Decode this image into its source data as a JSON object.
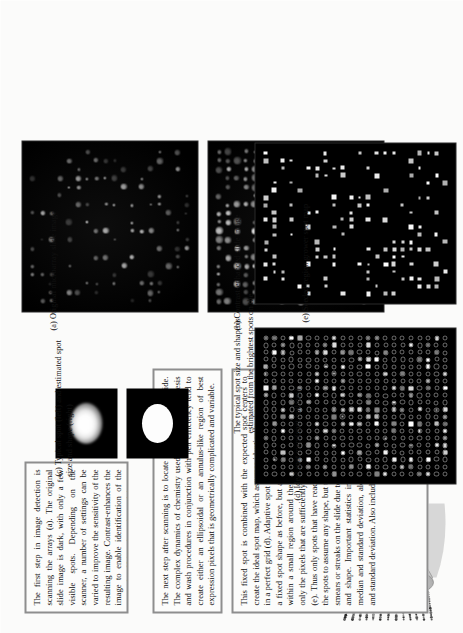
{
  "document": {
    "type": "figure-page",
    "orientation": "rotated-90-ccw",
    "page_background": "#fbfbfa",
    "ink_color": "#111111",
    "panel_border_color": "#8e8e8e"
  },
  "body_text": [
    {
      "id": "para-1",
      "text": "The first step in image detection is scanning the arrays (a). The original slide image is dark, with only a few visible spots. Depending on the scanner, a number of settings can be varied to improve the sensitivity of the resulting image. Contrast-enhances the image to enable identification of the spots (b). Using the enhanced image, initial spot center estimates are created  (c)."
    },
    {
      "id": "para-2",
      "text": "The next step after scanning is to locate each spot on the slide. The complex dynamics of chemistry used in the probe synthesis and wash procedures in conjunction with pen efficiency tend to create either an ellipsoidal or an annulus-like region of best expression pixels that is geometrically complicated and variable."
    },
    {
      "id": "para-3",
      "text": "This fixed spot is combined with the expected spot centers to create the ideal spot map, which assumes identically-shaped spots in a perfect grid (d). Adaptive spot identification methods: assume a fixed spot shape as before, but allows the spot centers to vary within a small region around the expected location or identify only the pixels that are sufficiently different from the background (e). Thus only spots that have reacted will be found. This allows the spots to assume any shape, but the algorithm may also identify smears or streaks on the slide due to the lack of constraints on size and shape. Important statistics include the typical spot mean, median and standard deviation, along with background intensity and standard deviation. Also included are size and shape statistics."
    }
  ],
  "annotation_note": {
    "id": "spot-size-note",
    "text": "The typical spot size and shape is estimated from the brightest spots on the slide"
  },
  "figures": [
    {
      "id": "fig-a",
      "caption": "(a) Original microarray slide image",
      "kind": "microarray-slide",
      "description": "dark scanned slide with few faint spots"
    },
    {
      "id": "fig-b",
      "caption": "(b) Contrast-enhanced slide image",
      "kind": "microarray-slide",
      "description": "contrast enhanced scan, many bright spots visible"
    },
    {
      "id": "fig-c",
      "caption": "(c) Typical spot (left) and estimated spot size and shape (right)",
      "kind": "spot-closeup-pair",
      "left_label": "typical spot",
      "right_label": "estimated spot size and shape"
    },
    {
      "id": "fig-d",
      "caption": "(d) Ideal spot map (spot outlines)",
      "kind": "spot-map-outlines",
      "description": "regular grid of circular spot outlines over the slide"
    },
    {
      "id": "fig-e",
      "caption": "(e) Seeded-region grower spot map",
      "kind": "spot-map-seeded",
      "description": "black background with detected white square spots"
    }
  ],
  "illustration": {
    "id": "scanner-illustration",
    "name": "microarray-scanner-diagram",
    "description": "grayscale drawing of a microarray scanner cone with rows of printed probe spots"
  }
}
